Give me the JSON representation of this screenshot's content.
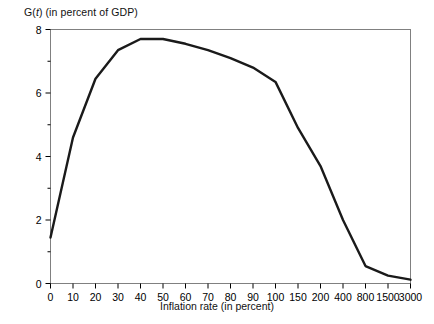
{
  "chart_data": {
    "type": "line",
    "title": "G(t) (in percent of GDP)",
    "title_prefix": "G(",
    "title_italic": "t",
    "title_suffix": ") (in percent of GDP)",
    "xlabel": "Inflation rate (in percent)",
    "ylabel": "",
    "categories": [
      "0",
      "10",
      "20",
      "30",
      "40",
      "50",
      "60",
      "70",
      "80",
      "90",
      "100",
      "150",
      "200",
      "400",
      "800",
      "1500",
      "3000"
    ],
    "values": [
      1.45,
      4.6,
      6.45,
      7.35,
      7.7,
      7.7,
      7.55,
      7.35,
      7.1,
      6.8,
      6.35,
      4.9,
      3.7,
      2.0,
      0.55,
      0.25,
      0.12
    ],
    "x_axis_type": "categorical",
    "ylim": [
      0,
      8
    ],
    "ytick_labels": [
      "0",
      "2",
      "4",
      "6",
      "8"
    ],
    "ytick_values": [
      0,
      2,
      4,
      6,
      8
    ],
    "yminor_values": [
      1,
      3,
      5,
      7
    ],
    "grid": false,
    "legend": "none",
    "line_color": "#1a1a1a",
    "line_width": 2.4,
    "frame_color": "#808080",
    "background": "#ffffff"
  }
}
